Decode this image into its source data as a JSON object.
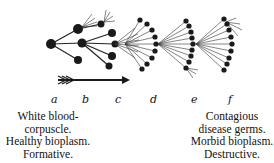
{
  "figure": {
    "stage_labels": [
      "a",
      "b",
      "c",
      "d",
      "e",
      "f"
    ],
    "left_caption": {
      "lines": [
        "White blood-",
        "corpuscle.",
        "Healthy bioplasm.",
        "Formative."
      ]
    },
    "right_caption": {
      "lines": [
        "Contagious",
        "disease germs.",
        "Morbid bioplasm.",
        "Destructive."
      ]
    },
    "arrow": "right-arrow",
    "ink_color": "#1a1a1a"
  }
}
